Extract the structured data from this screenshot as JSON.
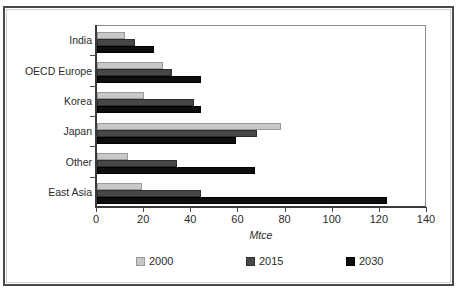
{
  "figure": {
    "title_partial": "",
    "width": 457,
    "height": 289
  },
  "chart_data": {
    "type": "bar",
    "orientation": "horizontal",
    "title": "",
    "xlabel": "Mtce",
    "ylabel": "",
    "xlim": [
      0,
      140
    ],
    "xticks": [
      0,
      20,
      40,
      60,
      80,
      100,
      120,
      140
    ],
    "grid": false,
    "legend_position": "bottom",
    "categories": [
      "India",
      "OECD Europe",
      "Korea",
      "Japan",
      "Other",
      "East Asia"
    ],
    "series": [
      {
        "name": "2000",
        "color": "#c8c8c8",
        "values": [
          12,
          28,
          20,
          78,
          13,
          19
        ]
      },
      {
        "name": "2015",
        "color": "#474747",
        "values": [
          16,
          32,
          41,
          68,
          34,
          44
        ]
      },
      {
        "name": "2030",
        "color": "#0d0d0d",
        "values": [
          24,
          44,
          44,
          59,
          67,
          123
        ]
      }
    ]
  },
  "legend": {
    "items": [
      {
        "label": "2000",
        "color": "#c8c8c8"
      },
      {
        "label": "2015",
        "color": "#474747"
      },
      {
        "label": "2030",
        "color": "#0d0d0d"
      }
    ]
  },
  "colors": {
    "frame": "#4a4a4a",
    "axis": "#3a3a3a",
    "plot_border": "#8d8d8d",
    "text": "#2b2b2b",
    "background": "#ffffff"
  }
}
